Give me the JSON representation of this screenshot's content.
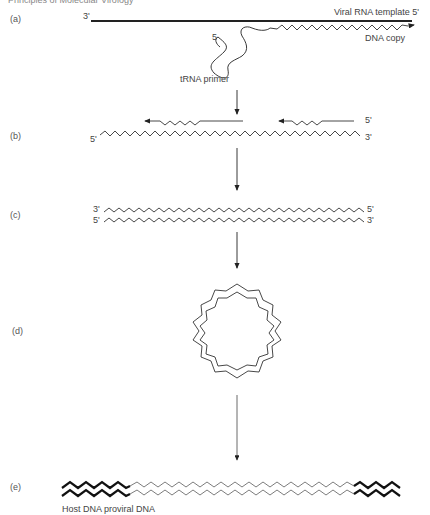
{
  "header": {
    "partial_text": "Principles of Molecular Virology"
  },
  "steps": [
    {
      "id": "a",
      "label": "(a)"
    },
    {
      "id": "b",
      "label": "(b)"
    },
    {
      "id": "c",
      "label": "(c)"
    },
    {
      "id": "d",
      "label": "(d)"
    },
    {
      "id": "e",
      "label": "(e)"
    }
  ],
  "panel_a": {
    "left_end": "3'",
    "template_label": "Viral RNA template 5'",
    "dna_copy_label": "DNA copy",
    "primer_5_label": "5",
    "primer_label": "tRNA primer"
  },
  "panel_b": {
    "top_right_end": "5'",
    "bottom_left_end": "5'",
    "bottom_right_end": "3'"
  },
  "panel_c": {
    "top_left": "3'",
    "top_right": "5'",
    "bottom_left": "5'",
    "bottom_right": "3'"
  },
  "panel_e": {
    "caption": "Host DNA proviral DNA"
  },
  "colors": {
    "line": "#222222",
    "text": "#444444",
    "background": "#ffffff"
  }
}
